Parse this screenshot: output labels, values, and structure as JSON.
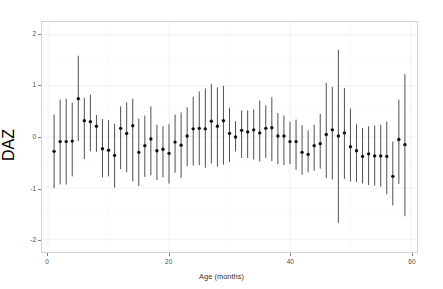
{
  "chart_data": {
    "type": "scatter",
    "title": "",
    "xlabel": "Age (months)",
    "ylabel": "DAZ",
    "xlim": [
      -1,
      61
    ],
    "ylim": [
      -2.25,
      2.25
    ],
    "xticks": [
      0,
      20,
      40,
      60
    ],
    "yticks": [
      2,
      1,
      0,
      -1,
      -2
    ],
    "xtick_labels": [
      "0",
      "20",
      "40",
      "60"
    ],
    "ytick_labels": [
      "2",
      "1",
      "0",
      "-1",
      "-2"
    ],
    "grid": true,
    "legend": "none",
    "marker": "filled-circle",
    "error_style": "vertical-line-range",
    "point_color": "#111111",
    "errorbar_color": "#3a3a3a",
    "panel_border_color": "#d2d2d2",
    "gridline_color": "#ececec",
    "background": "#ffffff",
    "x": [
      1,
      2,
      3,
      4,
      5,
      6,
      7,
      8,
      9,
      10,
      11,
      12,
      13,
      14,
      15,
      16,
      17,
      18,
      19,
      20,
      21,
      22,
      23,
      24,
      25,
      26,
      27,
      28,
      29,
      30,
      31,
      32,
      33,
      34,
      35,
      36,
      37,
      38,
      39,
      40,
      41,
      42,
      43,
      44,
      45,
      46,
      47,
      48,
      49,
      50,
      51,
      52,
      53,
      54,
      55,
      56,
      57,
      58,
      59
    ],
    "y": [
      -0.28,
      -0.09,
      -0.09,
      -0.08,
      0.75,
      0.32,
      0.3,
      0.21,
      -0.23,
      -0.26,
      -0.36,
      0.17,
      0.07,
      0.22,
      -0.3,
      -0.17,
      -0.04,
      -0.27,
      -0.24,
      -0.32,
      -0.1,
      -0.16,
      0.02,
      0.16,
      0.17,
      0.16,
      0.31,
      0.21,
      0.32,
      0.07,
      0.0,
      0.13,
      0.1,
      0.14,
      0.08,
      0.17,
      0.18,
      0.02,
      0.02,
      -0.09,
      -0.09,
      -0.3,
      -0.34,
      -0.17,
      -0.13,
      0.05,
      0.14,
      0.02,
      0.08,
      -0.19,
      -0.27,
      -0.38,
      -0.33,
      -0.37,
      -0.37,
      -0.38,
      -0.77,
      -0.05,
      -0.15
    ],
    "y_lower": [
      -1.0,
      -0.93,
      -0.93,
      -0.77,
      -0.08,
      -0.43,
      -0.28,
      -0.29,
      -0.79,
      -0.77,
      -0.99,
      -0.63,
      -0.69,
      -0.87,
      -0.96,
      -0.78,
      -0.75,
      -0.84,
      -0.79,
      -0.91,
      -0.7,
      -0.8,
      -0.57,
      -0.56,
      -0.55,
      -0.6,
      -0.52,
      -0.58,
      -0.54,
      -0.49,
      -0.28,
      -0.41,
      -0.41,
      -0.44,
      -0.48,
      -0.41,
      -0.47,
      -0.53,
      -0.55,
      -0.53,
      -0.64,
      -0.74,
      -0.69,
      -0.66,
      -0.62,
      -0.8,
      -0.83,
      -1.68,
      -0.82,
      -0.87,
      -0.88,
      -0.91,
      -0.94,
      -0.95,
      -0.97,
      -1.12,
      -1.34,
      -0.92,
      -1.55
    ],
    "y_upper": [
      0.44,
      0.73,
      0.75,
      0.67,
      1.59,
      0.77,
      0.83,
      0.43,
      0.35,
      0.33,
      0.26,
      0.6,
      0.68,
      0.75,
      0.36,
      0.42,
      0.6,
      0.24,
      0.21,
      0.25,
      0.44,
      0.48,
      0.58,
      0.79,
      0.89,
      0.95,
      1.04,
      0.97,
      1.0,
      0.57,
      0.31,
      0.52,
      0.52,
      0.54,
      0.71,
      0.62,
      0.78,
      0.47,
      0.42,
      0.3,
      0.34,
      0.23,
      0.13,
      0.24,
      0.45,
      1.06,
      0.98,
      1.71,
      0.96,
      0.56,
      0.25,
      0.18,
      0.21,
      0.22,
      0.24,
      0.3,
      -0.09,
      0.73,
      1.23
    ],
    "n_points": 59
  },
  "axes": {
    "x_title": "Age (months)",
    "y_title": "DAZ"
  }
}
